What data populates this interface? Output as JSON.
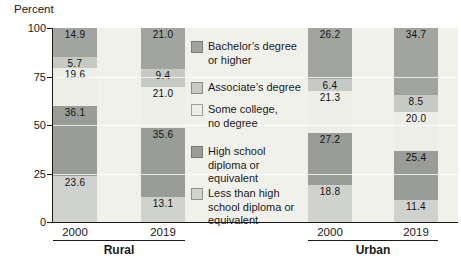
{
  "chart_data": {
    "type": "bar",
    "stacked": true,
    "title": "",
    "ylabel": "Percent",
    "ylim": [
      0,
      100
    ],
    "yticks": [
      0,
      25,
      50,
      75,
      100
    ],
    "grid": "white horizontal gridlines at 25, 50, 75",
    "legend_position": "center, between Rural and Urban bar groups",
    "categories": [
      "Rural 2000",
      "Rural 2019",
      "Urban 2000",
      "Urban 2019"
    ],
    "groups": [
      {
        "label": "Rural",
        "years": [
          "2000",
          "2019"
        ]
      },
      {
        "label": "Urban",
        "years": [
          "2000",
          "2019"
        ]
      }
    ],
    "series": [
      {
        "name": "Bachelor’s degree or higher",
        "legend_lines": [
          "Bachelor’s degree",
          "or higher"
        ],
        "color": "#a2a4a0",
        "values": [
          14.9,
          21.0,
          26.2,
          34.7
        ]
      },
      {
        "name": "Associate’s degree",
        "legend_lines": [
          "Associate’s degree"
        ],
        "color": "#c7c9c5",
        "values": [
          5.7,
          9.4,
          6.4,
          8.5
        ]
      },
      {
        "name": "Some college, no degree",
        "legend_lines": [
          "Some college,",
          "no degree"
        ],
        "color": "#edeee8",
        "values": [
          19.6,
          21.0,
          21.3,
          20.0
        ]
      },
      {
        "name": "High school diploma or equivalent",
        "legend_lines": [
          "High school",
          "diploma or",
          "equivalent"
        ],
        "color": "#9a9c98",
        "values": [
          36.1,
          35.6,
          27.2,
          25.4
        ]
      },
      {
        "name": "Less than high school diploma or equivalent",
        "legend_lines": [
          "Less than high",
          "school diploma or",
          "equivalent"
        ],
        "color": "#d0d2ce",
        "values": [
          23.6,
          13.1,
          18.8,
          11.4
        ]
      }
    ],
    "axis_color": "#1a1a1a",
    "plot_background": "#f1f1ec"
  }
}
